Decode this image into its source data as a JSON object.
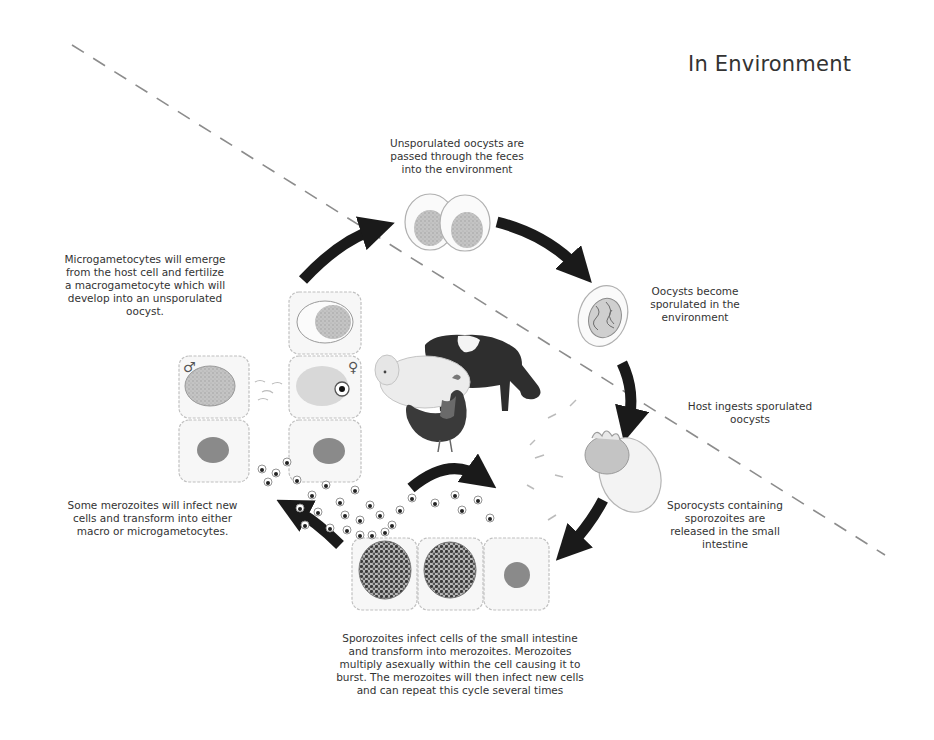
{
  "title": "In Environment",
  "colors": {
    "arrow": "#1a1a1a",
    "cell_outline": "#bdbdbd",
    "cell_fill": "#f4f4f4",
    "nucleus": "#8a8a8a",
    "oocyst_inner": "#b5b5b5",
    "dashed_line": "#8c8c8c",
    "text": "#333333"
  },
  "labels": {
    "unsporulated": [
      "Unsporulated oocysts are",
      "passed through the feces",
      "into the environment"
    ],
    "sporulated": [
      "Oocysts become",
      "sporulated in the",
      "environment"
    ],
    "ingest": [
      "Host ingests sporulated",
      "oocysts"
    ],
    "sporocysts": [
      "Sporocysts containing",
      "sporozoites are",
      "released in the small",
      "intestine"
    ],
    "sporozoites": [
      "Sporozoites infect cells of the small intestine",
      "and transform into merozoites.  Merozoites",
      "multiply asexually within the cell causing it to",
      "burst.  The merozoites will then infect new cells",
      "and can repeat this cycle several times"
    ],
    "merozoites": [
      "Some merozoites will infect new",
      "cells and transform into either",
      "macro or microgametocytes."
    ],
    "microgametocytes": [
      "Microgametocytes will emerge",
      "from the host cell and fertilize",
      "a macrogametocyte which will",
      "develop into an unsporulated",
      "oocyst."
    ]
  },
  "symbols": {
    "male": "♂",
    "female": "♀"
  },
  "icons": [
    "cycle-arrow-icon",
    "oocyst-icon",
    "sporulated-oocyst-icon",
    "host-animals-icon",
    "intestinal-cell-icon",
    "merozoite-icon",
    "male-symbol-icon",
    "female-symbol-icon"
  ]
}
